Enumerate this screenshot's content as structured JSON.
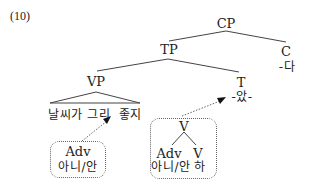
{
  "example_number": "(10)",
  "tree": {
    "root": {
      "label": "CP"
    },
    "tp": {
      "label": "TP"
    },
    "c": {
      "label": "C",
      "morpheme": "-다"
    },
    "vp": {
      "label": "VP",
      "terminal": "날씨가 그리  좋지"
    },
    "t": {
      "label": "T",
      "morpheme": "-았-"
    }
  },
  "left_box": {
    "category": "Adv",
    "form": "아니/안"
  },
  "right_box": {
    "head": "V",
    "children": [
      {
        "category": "Adv",
        "form": "아니/안"
      },
      {
        "category": "V",
        "form": "하"
      }
    ]
  },
  "colors": {
    "line": "#444444",
    "dotted": "#666666",
    "text": "#222222"
  }
}
